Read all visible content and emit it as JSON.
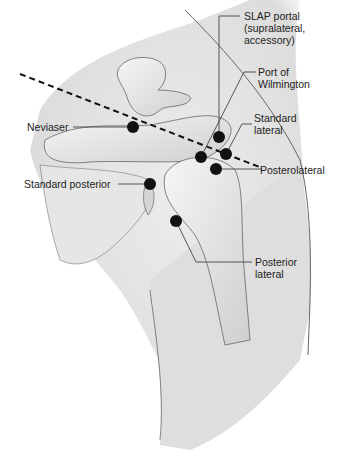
{
  "figure": {
    "labels": {
      "slap": [
        "SLAP portal",
        "(supralateral,",
        "accessory)"
      ],
      "wilmington": [
        "Port of",
        "Wilmington"
      ],
      "standard_lateral": [
        "Standard",
        "lateral"
      ],
      "posterolateral": [
        "Posterolateral"
      ],
      "neviaser": [
        "Neviaser"
      ],
      "standard_posterior": [
        "Standard posterior"
      ],
      "posterior_lateral": [
        "Posterior",
        "lateral"
      ]
    },
    "colors": {
      "skin": "#e4e4e4",
      "bone": "#f0f0f0",
      "outline": "#555555",
      "portal_dot": "#111111",
      "leader_line": "#444444"
    }
  }
}
